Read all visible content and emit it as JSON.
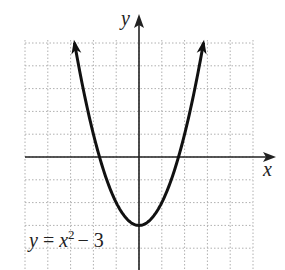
{
  "chart_data": {
    "type": "line",
    "title": "",
    "equation_label": {
      "y": "y",
      "eq": "=",
      "x": "x",
      "exp": "2",
      "rest": "− 3"
    },
    "xlabel": "x",
    "ylabel": "y",
    "function": "y = x^2 - 3",
    "xlim": [
      -5,
      5
    ],
    "ylim": [
      -5,
      5
    ],
    "grid": true,
    "grid_style": "dotted",
    "x": [
      -2.83,
      -2,
      -1.73,
      -1,
      0,
      1,
      1.73,
      2,
      2.83
    ],
    "series": [
      {
        "name": "y = x^2 - 3",
        "values": [
          5,
          1,
          0,
          -2,
          -3,
          -2,
          0,
          1,
          5
        ]
      }
    ],
    "vertex": [
      0,
      -3
    ],
    "x_intercepts": [
      -1.732,
      1.732
    ],
    "arrows_on_ends": true
  },
  "colors": {
    "grid": "#b0b0b0",
    "axis": "#222222",
    "curve": "#111111",
    "background": "#ffffff"
  }
}
